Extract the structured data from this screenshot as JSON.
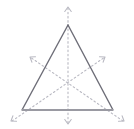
{
  "figure": {
    "type": "geometry-diagram",
    "canvas": {
      "width": 134,
      "height": 129
    },
    "background_color": "#ffffff"
  },
  "shape": {
    "name": "equilateral-triangle",
    "stroke_color": "#6e6e78",
    "stroke_width": 1.4,
    "fill": "none",
    "vertices": [
      {
        "label": "apex",
        "x": 68,
        "y": 25
      },
      {
        "label": "bottom-left",
        "x": 22,
        "y": 110
      },
      {
        "label": "bottom-right",
        "x": 113,
        "y": 110
      }
    ],
    "base_edge": {
      "name": "base",
      "stroke_color": "#9a9aa2",
      "stroke_width": 2.2,
      "from": {
        "x": 22,
        "y": 110
      },
      "to": {
        "x": 113,
        "y": 110
      }
    }
  },
  "centroid": {
    "x": 68,
    "y": 82
  },
  "symmetry_axes": [
    {
      "name": "vertical-axis",
      "through_vertex": "apex",
      "through_midpoint": "base-midpoint",
      "start": {
        "x": 68,
        "y": 8
      },
      "end": {
        "x": 68,
        "y": 124
      },
      "stroke_color": "#b9b9c2",
      "stroke_width": 1.1,
      "dash_pattern": "1.6 2.6"
    },
    {
      "name": "axis-from-bottom-left",
      "through_vertex": "bottom-left",
      "through_midpoint": "right-edge-midpoint",
      "start": {
        "x": 12,
        "y": 121
      },
      "end": {
        "x": 105,
        "y": 57
      },
      "stroke_color": "#b9b9c2",
      "stroke_width": 1.1,
      "dash_pattern": "1.6 2.6"
    },
    {
      "name": "axis-from-bottom-right",
      "through_vertex": "bottom-right",
      "through_midpoint": "left-edge-midpoint",
      "start": {
        "x": 123,
        "y": 121
      },
      "end": {
        "x": 30,
        "y": 57
      },
      "stroke_color": "#b9b9c2",
      "stroke_width": 1.1,
      "dash_pattern": "1.6 2.6"
    }
  ],
  "arrowheads": [
    {
      "name": "arrow-top",
      "tip": {
        "x": 68,
        "y": 7
      },
      "direction": "up",
      "angle_deg": -90
    },
    {
      "name": "arrow-bottom",
      "tip": {
        "x": 68,
        "y": 124
      },
      "direction": "down",
      "angle_deg": 90
    },
    {
      "name": "arrow-upper-left",
      "tip": {
        "x": 30,
        "y": 57
      },
      "direction": "up-left",
      "angle_deg": 214
    },
    {
      "name": "arrow-upper-right",
      "tip": {
        "x": 105,
        "y": 57
      },
      "direction": "up-right",
      "angle_deg": -34
    },
    {
      "name": "arrow-lower-left",
      "tip": {
        "x": 11,
        "y": 121
      },
      "direction": "down-left",
      "angle_deg": 146
    },
    {
      "name": "arrow-lower-right",
      "tip": {
        "x": 124,
        "y": 121
      },
      "direction": "down-right",
      "angle_deg": 34
    }
  ],
  "arrow_style": {
    "stroke_color": "#b9b9c2",
    "stroke_width": 1.1,
    "head_length": 5.5,
    "head_spread_deg": 36
  }
}
